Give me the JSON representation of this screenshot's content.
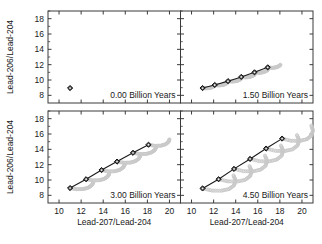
{
  "figure": {
    "xlabel": "Lead-207/Lead-204",
    "ylabel": "Lead-206/Lead-204",
    "xticks": [
      10,
      12,
      14,
      16,
      18,
      20
    ],
    "yticks": [
      8,
      10,
      12,
      14,
      16,
      18
    ],
    "xlim": [
      9,
      21
    ],
    "ylim": [
      7,
      19
    ],
    "colors": {
      "line": "#1a1a1a",
      "marker_face": "#4d4d4d",
      "marker_edge": "#111111",
      "cloud": "#c9c9c9",
      "axis": "#3b3b3b",
      "text": "#1a1a1a",
      "background": "#ffffff"
    }
  },
  "chart_data": {
    "type": "scatter",
    "title": "",
    "xlabel": "Lead-207/Lead-204",
    "ylabel": "Lead-206/Lead-204",
    "xlim": [
      9,
      21
    ],
    "ylim": [
      7,
      19
    ],
    "xticks": [
      10,
      12,
      14,
      16,
      18,
      20
    ],
    "yticks": [
      8,
      10,
      12,
      14,
      16,
      18
    ],
    "grid": false,
    "legend": "none",
    "panels": [
      {
        "label": "0.00 Billion Years",
        "isochron": {
          "x": [
            11.0
          ],
          "y": [
            8.95
          ]
        },
        "cloud": []
      },
      {
        "label": "1.50 Billion Years",
        "isochron": {
          "x": [
            11.0,
            12.1,
            13.3,
            14.5,
            15.7,
            16.9
          ],
          "y": [
            8.95,
            9.35,
            9.85,
            10.4,
            11.0,
            11.65
          ]
        },
        "cloud": [
          {
            "x": [
              11.0,
              11.3,
              11.6,
              11.85,
              12.05
            ],
            "y": [
              8.95,
              8.92,
              8.95,
              9.05,
              9.2
            ]
          },
          {
            "x": [
              12.1,
              12.45,
              12.8,
              13.05,
              13.25
            ],
            "y": [
              9.35,
              9.3,
              9.34,
              9.46,
              9.62
            ]
          },
          {
            "x": [
              13.3,
              13.65,
              14.0,
              14.28,
              14.48
            ],
            "y": [
              9.85,
              9.8,
              9.85,
              9.97,
              10.14
            ]
          },
          {
            "x": [
              14.5,
              14.9,
              15.25,
              15.52,
              15.72
            ],
            "y": [
              10.4,
              10.34,
              10.4,
              10.53,
              10.7
            ]
          },
          {
            "x": [
              15.7,
              16.1,
              16.45,
              16.72,
              16.92
            ],
            "y": [
              11.0,
              10.94,
              11.0,
              11.14,
              11.32
            ]
          },
          {
            "x": [
              16.9,
              17.3,
              17.65,
              17.9,
              18.05
            ],
            "y": [
              11.65,
              11.58,
              11.65,
              11.79,
              11.98
            ]
          }
        ]
      },
      {
        "label": "3.00 Billion Years",
        "isochron": {
          "x": [
            11.0,
            12.45,
            13.85,
            15.25,
            16.7,
            18.1
          ],
          "y": [
            8.95,
            10.1,
            11.3,
            12.4,
            13.55,
            14.6
          ]
        },
        "cloud": [
          {
            "x": [
              11.0,
              11.6,
              12.2,
              12.65,
              12.95,
              13.1
            ],
            "y": [
              8.95,
              8.8,
              8.82,
              9.0,
              9.3,
              9.65
            ]
          },
          {
            "x": [
              12.45,
              13.05,
              13.65,
              14.1,
              14.4,
              14.55
            ],
            "y": [
              10.1,
              9.95,
              9.97,
              10.15,
              10.45,
              10.8
            ]
          },
          {
            "x": [
              13.85,
              14.45,
              15.05,
              15.5,
              15.8,
              15.95
            ],
            "y": [
              11.3,
              11.12,
              11.14,
              11.32,
              11.62,
              11.98
            ]
          },
          {
            "x": [
              15.25,
              15.85,
              16.45,
              16.9,
              17.2,
              17.35
            ],
            "y": [
              12.4,
              12.25,
              12.27,
              12.45,
              12.75,
              13.12
            ]
          },
          {
            "x": [
              16.7,
              17.3,
              17.9,
              18.35,
              18.65,
              18.8
            ],
            "y": [
              13.55,
              13.38,
              13.4,
              13.58,
              13.88,
              14.25
            ]
          },
          {
            "x": [
              18.1,
              18.7,
              19.25,
              19.65,
              19.9,
              20.0
            ],
            "y": [
              14.6,
              14.45,
              14.48,
              14.66,
              14.95,
              15.3
            ]
          }
        ]
      },
      {
        "label": "4.50 Billion Years",
        "isochron": {
          "x": [
            11.0,
            12.45,
            13.85,
            15.3,
            16.75,
            18.2
          ],
          "y": [
            8.9,
            10.1,
            11.45,
            12.75,
            14.1,
            15.4
          ]
        },
        "cloud": [
          {
            "x": [
              11.0,
              11.85,
              12.7,
              13.4,
              13.85,
              14.0,
              13.8
            ],
            "y": [
              8.9,
              8.62,
              8.6,
              8.82,
              9.3,
              9.95,
              10.6
            ]
          },
          {
            "x": [
              12.45,
              13.3,
              14.15,
              14.85,
              15.3,
              15.45,
              15.25
            ],
            "y": [
              10.1,
              9.82,
              9.8,
              10.02,
              10.5,
              11.15,
              11.8
            ]
          },
          {
            "x": [
              13.85,
              14.7,
              15.55,
              16.25,
              16.7,
              16.85,
              16.65
            ],
            "y": [
              11.45,
              11.15,
              11.12,
              11.35,
              11.85,
              12.5,
              13.18
            ]
          },
          {
            "x": [
              15.3,
              16.15,
              17.0,
              17.7,
              18.15,
              18.3,
              18.1
            ],
            "y": [
              12.75,
              12.45,
              12.42,
              12.65,
              13.15,
              13.82,
              14.5
            ]
          },
          {
            "x": [
              16.75,
              17.6,
              18.45,
              19.15,
              19.6,
              19.75,
              19.55
            ],
            "y": [
              14.1,
              13.8,
              13.78,
              14.0,
              14.5,
              15.18,
              15.85
            ]
          },
          {
            "x": [
              18.2,
              19.0,
              19.8,
              20.45,
              20.85,
              21.0,
              20.85
            ],
            "y": [
              15.4,
              15.12,
              15.1,
              15.32,
              15.8,
              16.45,
              17.1
            ]
          }
        ]
      }
    ]
  }
}
